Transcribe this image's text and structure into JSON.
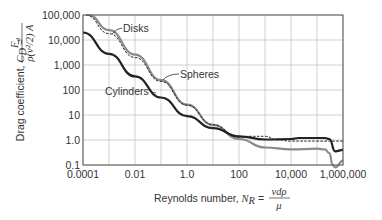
{
  "chart_data": {
    "type": "line",
    "title": "",
    "xlabel": "Reynolds number, N_R = v d ρ / μ",
    "ylabel": "Drag coefficient, C_D = F_d / (ρ(v²/2) A)",
    "xscale": "log",
    "yscale": "log",
    "xlim": [
      0.0001,
      1000000
    ],
    "ylim": [
      0.1,
      100000
    ],
    "grid": true,
    "legend_position": "inline annotations",
    "x_tick_labels": [
      "0.0001",
      "0.01",
      "1.0",
      "100",
      "10,000",
      "1,000,000"
    ],
    "y_tick_labels": [
      "0.1",
      "1.0",
      "10",
      "100",
      "1,000",
      "10,000",
      "100,000"
    ],
    "annotations": [
      "Disks",
      "Spheres",
      "Cylinders"
    ],
    "series": [
      {
        "name": "Cylinders",
        "style": "solid-black-thick",
        "x": [
          0.0001,
          0.001,
          0.01,
          0.1,
          1,
          10,
          100,
          1000,
          10000,
          20000,
          100000,
          200000,
          300000,
          500000,
          1000000
        ],
        "y": [
          20000,
          2800,
          350,
          50,
          9,
          3,
          1.4,
          1.05,
          1.1,
          1.2,
          1.2,
          1.2,
          1.1,
          0.35,
          0.4
        ]
      },
      {
        "name": "Disks",
        "style": "solid-gray-thick",
        "x": [
          0.00016,
          0.001,
          0.01,
          0.1,
          1,
          10,
          100,
          1000,
          10000,
          100000,
          200000,
          300000,
          400000,
          500000,
          1000000
        ],
        "y": [
          100000,
          25000,
          2600,
          250,
          26,
          4,
          1.1,
          0.5,
          0.42,
          0.45,
          0.42,
          0.3,
          0.1,
          0.08,
          0.15
        ]
      },
      {
        "name": "Spheres",
        "style": "dashed-black",
        "x": [
          0.00013,
          0.001,
          0.01,
          0.1,
          1,
          10,
          100,
          300,
          1000,
          3000,
          10000,
          100000,
          1000000
        ],
        "y": [
          100000,
          18000,
          2000,
          220,
          25,
          4,
          1.3,
          1.4,
          1.4,
          1.0,
          0.9,
          0.9,
          0.9
        ]
      }
    ]
  },
  "labels": {
    "y_axis_text": "Drag coefficient, ",
    "y_axis_symbol": "C",
    "y_axis_sub": "D",
    "y_axis_eq": " = ",
    "y_axis_num": "F",
    "y_axis_num_sub": "d",
    "y_axis_den": "ρ(v²/2) A",
    "x_axis_text": "Reynolds number, ",
    "x_axis_symbol": "N",
    "x_axis_sub": "R",
    "x_axis_eq": " = ",
    "x_axis_num": "vdρ",
    "x_axis_den": "μ"
  },
  "colors": {
    "cylinders": "#222222",
    "disks": "#8a8a8a",
    "spheres": "#222222",
    "grid": "#bdbdbd",
    "frame": "#555555"
  }
}
